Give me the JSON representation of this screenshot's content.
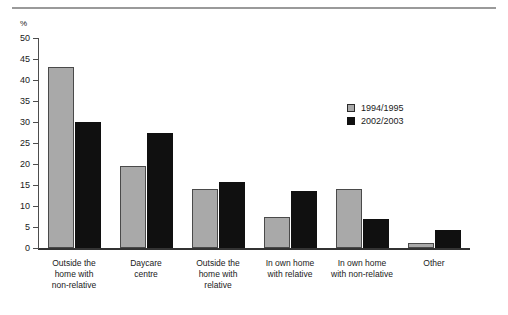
{
  "header": {
    "clipped_title": "",
    "rule_color": "#9a9a9a"
  },
  "legend": {
    "position": "inside-upper-right",
    "entries": [
      {
        "label": "1994/1995",
        "swatch": "legend-swatch-gray",
        "color": "#a9a9a9"
      },
      {
        "label": "2002/2003",
        "swatch": "legend-swatch-black",
        "color": "#101010"
      }
    ]
  },
  "axis": {
    "y_unit": "%",
    "y_ticks": [
      "0",
      "5",
      "10",
      "15",
      "20",
      "25",
      "30",
      "35",
      "40",
      "45",
      "50"
    ]
  },
  "chart_data": {
    "type": "bar",
    "title": "",
    "subtitle": "",
    "xlabel": "",
    "ylabel": "%",
    "ylim": [
      0,
      50
    ],
    "ytick_step": 5,
    "grid": false,
    "legend_position": "inside-upper-right",
    "categories": [
      "Outside the home with non-relative",
      "Daycare centre",
      "Outside the home with relative",
      "In own home with relative",
      "In own home with non-relative",
      "Other"
    ],
    "category_label_lines": [
      [
        "Outside the",
        "home with",
        "non-relative"
      ],
      [
        "Daycare",
        "centre"
      ],
      [
        "Outside the",
        "home with",
        "relative"
      ],
      [
        "In own home",
        "with relative"
      ],
      [
        "In own home",
        "with non-relative"
      ],
      [
        "Other"
      ]
    ],
    "series": [
      {
        "name": "1994/1995",
        "color": "#a9a9a9",
        "values": [
          43.0,
          19.5,
          14.0,
          7.5,
          14.0,
          1.3
        ]
      },
      {
        "name": "2002/2003",
        "color": "#101010",
        "values": [
          30.0,
          27.5,
          15.7,
          13.5,
          7.0,
          4.3
        ]
      }
    ]
  }
}
